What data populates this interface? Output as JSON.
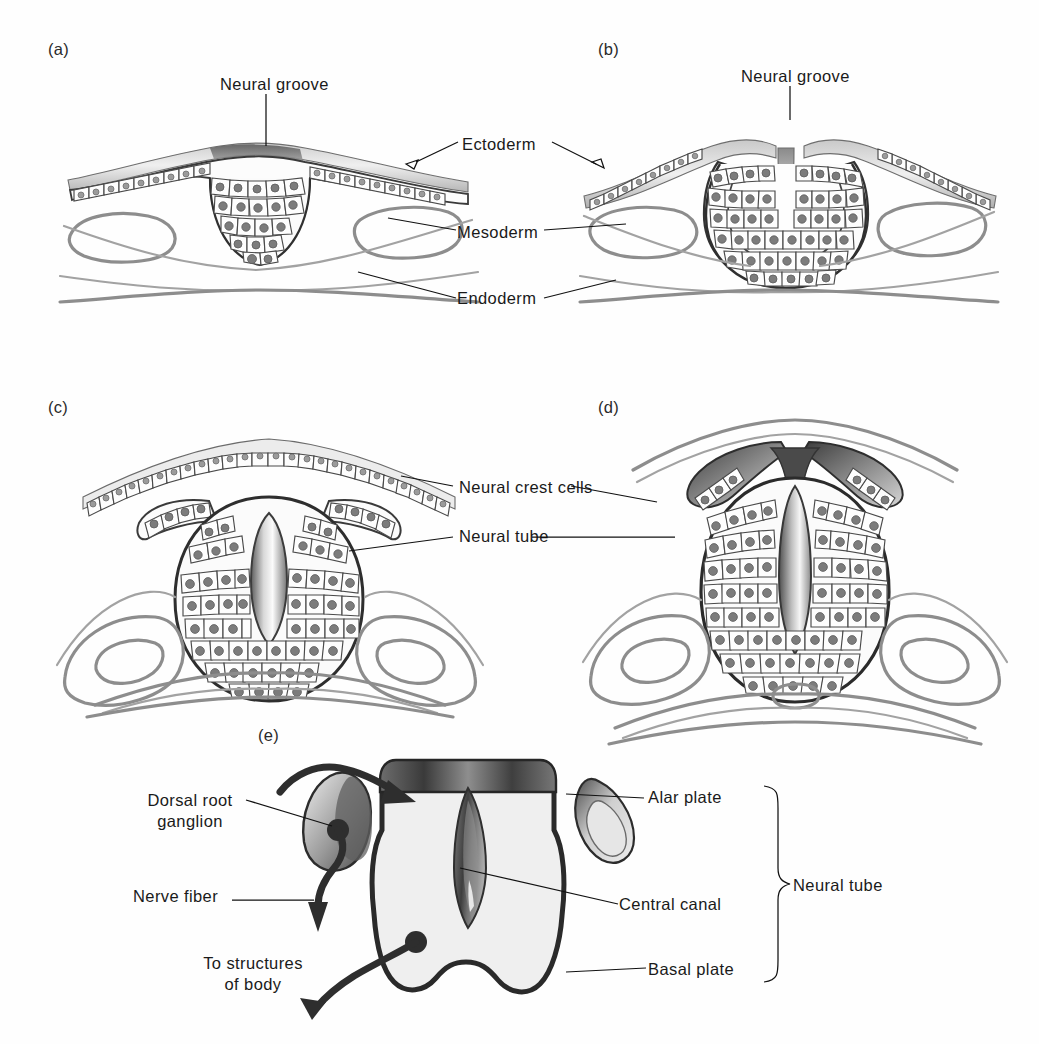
{
  "figure": {
    "type": "anatomical-illustration",
    "background_color": "#fefefe",
    "ink_color": "#2b2b2b",
    "grey_tone": "#8d8d8d"
  },
  "panels": [
    {
      "id": "a",
      "key": "a",
      "label": "(a)"
    },
    {
      "id": "b",
      "key": "b",
      "label": "(b)"
    },
    {
      "id": "c",
      "key": "c",
      "label": "(c)"
    },
    {
      "id": "d",
      "key": "d",
      "label": "(d)"
    },
    {
      "id": "e",
      "key": "e",
      "label": "(e)"
    }
  ],
  "labels": {
    "neural_groove_a": "Neural groove",
    "neural_groove_b": "Neural groove",
    "ectoderm": "Ectoderm",
    "mesoderm": "Mesoderm",
    "endoderm": "Endoderm",
    "neural_crest_cells": "Neural crest cells",
    "neural_tube_cd": "Neural tube",
    "dorsal_root_ganglion_line1": "Dorsal root",
    "dorsal_root_ganglion_line2": "ganglion",
    "nerve_fiber": "Nerve fiber",
    "to_structures_line1": "To structures",
    "to_structures_line2": "of body",
    "alar_plate": "Alar plate",
    "central_canal": "Central canal",
    "basal_plate": "Basal plate",
    "neural_tube_bracket": "Neural tube"
  }
}
